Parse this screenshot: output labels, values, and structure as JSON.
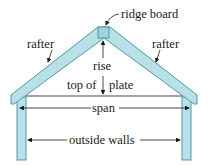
{
  "diagram": {
    "type": "roof-framing",
    "labels": {
      "ridge_board": "ridge board",
      "rafter_left": "rafter",
      "rafter_right": "rafter",
      "rise": "rise",
      "top_of": "top of",
      "plate": "plate",
      "span": "span",
      "outside_walls": "outside walls"
    },
    "colors": {
      "member_fill": "#b8e0e6",
      "member_stroke": "#4a9aa6",
      "line": "#1a1a1a",
      "background": "#ffffff"
    }
  }
}
